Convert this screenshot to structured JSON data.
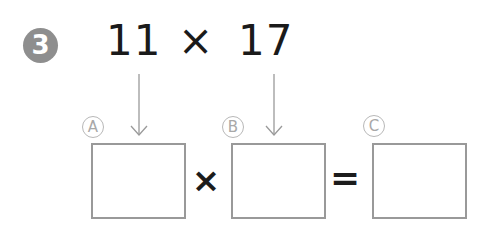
{
  "problem": {
    "number": "3",
    "operand_a": "11",
    "operator": "×",
    "operand_b": "17"
  },
  "equation": {
    "box_a_label": "A",
    "box_b_label": "B",
    "box_c_label": "C",
    "multiply_sign": "×",
    "equals_sign": "=",
    "box_a_value": "",
    "box_b_value": "",
    "box_c_value": ""
  },
  "colors": {
    "badge": "#8e8e8e",
    "text": "#1a1a1a",
    "box_border": "#999999",
    "arrow": "#9a9a9a",
    "label_circle": "#b8b8b8"
  }
}
